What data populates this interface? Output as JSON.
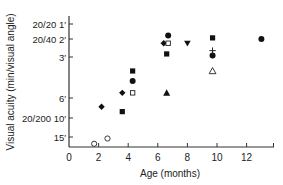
{
  "chart_data": {
    "type": "scatter",
    "title": "",
    "xlabel": "Age (months)",
    "ylabel": "Visual acuity (min/visual angle)",
    "xlim": [
      0,
      14
    ],
    "x_ticks": [
      0,
      2,
      4,
      6,
      8,
      10,
      12
    ],
    "y_scale": "log (inverted; smaller angle at top)",
    "y_ticks": [
      {
        "value": 1,
        "label": "20/20 1′"
      },
      {
        "value": 2,
        "label": "20/40 2′"
      },
      {
        "value": 3,
        "label": "3′"
      },
      {
        "value": 6,
        "label": "6′"
      },
      {
        "value": 10,
        "label": "20/200 10′"
      },
      {
        "value": 15,
        "label": "15′"
      }
    ],
    "grid": false,
    "legend": null,
    "series": [
      {
        "marker": "open-circle",
        "points": [
          [
            1.7,
            20
          ],
          [
            2.6,
            16
          ]
        ]
      },
      {
        "marker": "filled-diamond",
        "points": [
          [
            2.2,
            7.5
          ],
          [
            3.6,
            5.5
          ],
          [
            6.4,
            2.2
          ]
        ]
      },
      {
        "marker": "filled-square",
        "points": [
          [
            3.6,
            8.5
          ],
          [
            4.3,
            3.8
          ],
          [
            6.6,
            2.8
          ],
          [
            9.7,
            1.9
          ]
        ]
      },
      {
        "marker": "filled-circle",
        "points": [
          [
            4.3,
            4.5
          ],
          [
            6.7,
            1.7
          ],
          [
            9.7,
            2.9
          ],
          [
            13.0,
            2.0
          ]
        ]
      },
      {
        "marker": "open-square",
        "points": [
          [
            4.3,
            5.5
          ],
          [
            6.7,
            2.2
          ]
        ]
      },
      {
        "marker": "filled-triangle",
        "points": [
          [
            6.6,
            5.5
          ]
        ]
      },
      {
        "marker": "filled-inverted-triangle",
        "points": [
          [
            8.0,
            2.2
          ]
        ]
      },
      {
        "marker": "plus",
        "points": [
          [
            9.7,
            2.6
          ]
        ]
      },
      {
        "marker": "open-triangle",
        "points": [
          [
            9.7,
            3.8
          ]
        ]
      }
    ]
  },
  "axis": {
    "x_tick_labels": [
      "0",
      "2",
      "4",
      "6",
      "8",
      "10",
      "12"
    ],
    "y_tick_labels": [
      "20/20 1′",
      "20/40 2′",
      "3′",
      "6′",
      "20/200 10′",
      "15′"
    ]
  }
}
